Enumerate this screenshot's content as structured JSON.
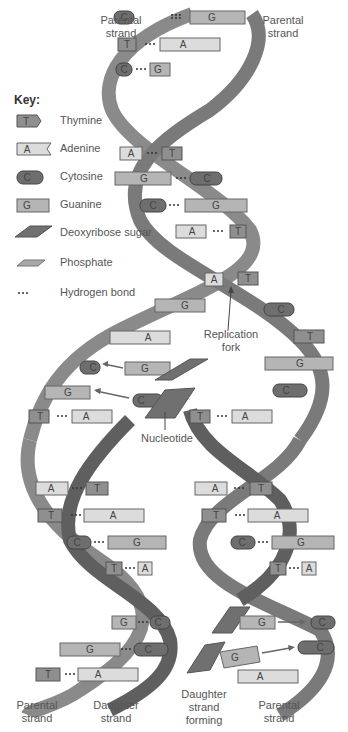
{
  "labels": {
    "parental_top_left": "Parental strand",
    "parental_top_right": "Parental strand",
    "replication_fork": "Replication fork",
    "nucleotide": "Nucleotide",
    "parental_bottom_left": "Parental strand",
    "daughter_bottom_left": "Daughter strand",
    "daughter_forming": "Daughter strand forming",
    "parental_bottom_right": "Parental strand"
  },
  "key": {
    "title": "Key:",
    "items": [
      {
        "symbol": "T",
        "label": "Thymine",
        "color": "#8f8f8f"
      },
      {
        "symbol": "A",
        "label": "Adenine",
        "color": "#dcdcdc"
      },
      {
        "symbol": "C",
        "label": "Cytosine",
        "color": "#6e6e6e"
      },
      {
        "symbol": "G",
        "label": "Guanine",
        "color": "#b5b5b5"
      },
      {
        "symbol": "",
        "label": "Deoxyribose sugar",
        "color": "#707070"
      },
      {
        "symbol": "",
        "label": "Phosphate",
        "color": "#a8a8a8"
      },
      {
        "symbol": "...",
        "label": "Hydrogen bond",
        "color": "#333333"
      }
    ]
  },
  "base_pairs_top": [
    {
      "left": "C",
      "right": "G"
    },
    {
      "left": "T",
      "right": "A"
    },
    {
      "left": "C",
      "right": "G"
    },
    {
      "left": "A",
      "right": "T"
    },
    {
      "left": "G",
      "right": "C"
    },
    {
      "left": "C",
      "right": "G"
    },
    {
      "left": "A",
      "right": "T"
    }
  ],
  "fork_unpaired": {
    "left_strand": [
      "A",
      "G",
      "A"
    ],
    "right_strand": [
      "T",
      "C",
      "T",
      "G",
      "C"
    ],
    "incoming": [
      {
        "free": "G",
        "target": "C"
      },
      {
        "free": "C",
        "target": "G"
      }
    ]
  },
  "left_daughter_pairs": [
    {
      "left": "T",
      "right": "A"
    },
    {
      "left": "A",
      "right": "T"
    },
    {
      "left": "T",
      "right": "A"
    },
    {
      "left": "C",
      "right": "G"
    },
    {
      "left": "T",
      "right": "A"
    },
    {
      "left": "G",
      "right": "C"
    },
    {
      "left": "G",
      "right": "C"
    },
    {
      "left": "T",
      "right": "A"
    }
  ],
  "right_daughter_pairs": [
    {
      "left": "T",
      "right": "A"
    },
    {
      "left": "A",
      "right": "T"
    },
    {
      "left": "T",
      "right": "A"
    },
    {
      "left": "C",
      "right": "G"
    },
    {
      "left": "T",
      "right": "A"
    }
  ],
  "right_forming": [
    {
      "free": "G",
      "target": "C"
    },
    {
      "free": "G",
      "target": "C"
    },
    {
      "free": "",
      "target": "A"
    }
  ]
}
